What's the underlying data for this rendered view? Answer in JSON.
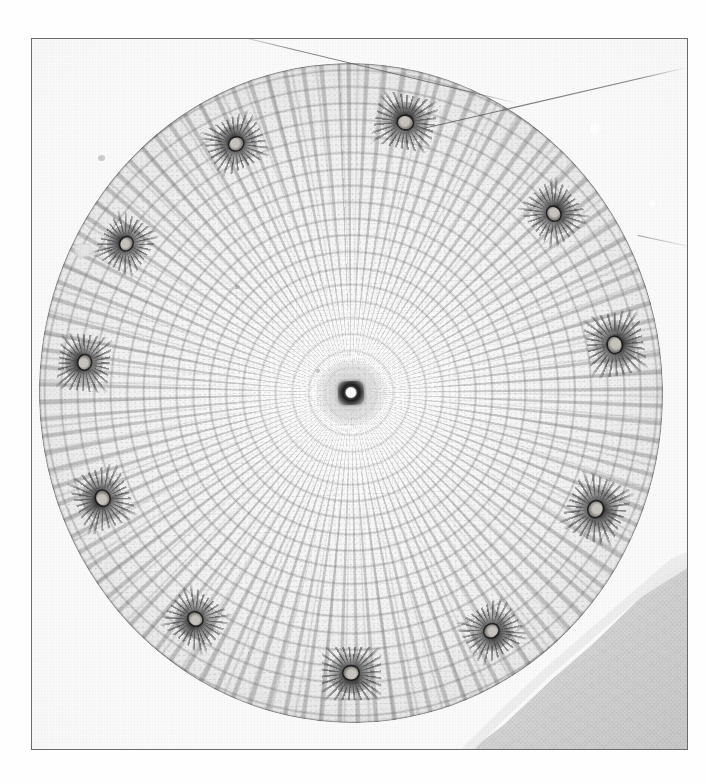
{
  "plate": {
    "medium": "monochrome photographic plate",
    "background_color": "#ffffff",
    "plate_color": "#fafafa",
    "frame_border_color": "#6b6b6b",
    "frame": {
      "x": 31,
      "y": 38,
      "width": 657,
      "height": 712
    }
  },
  "specimen": {
    "kind": "plant-stem-cross-section",
    "outline_shape": "ellipse",
    "center": {
      "x": 348,
      "y": 393
    },
    "radius_x": 312,
    "radius_y": 330,
    "tissue_zones": [
      {
        "name": "central-strand",
        "tone": "#1d1d1d"
      },
      {
        "name": "inner-pith-parenchyma",
        "tone": "#fdfdfd"
      },
      {
        "name": "radial-parenchyma",
        "tone": "#f2f2f2"
      },
      {
        "name": "cortex",
        "tone": "#d2d2d2"
      },
      {
        "name": "epidermis",
        "tone": "#8c8c8c"
      }
    ]
  },
  "core": {
    "name": "central-canal",
    "ring_color": "#1d1d1d",
    "lumen_color": "#ffffff"
  },
  "vascular_bundles": [
    {
      "id": 1,
      "angle_deg": -76,
      "radius_pct": 84,
      "scale": 1.0,
      "rotate_deg": 14
    },
    {
      "id": 2,
      "angle_deg": -38,
      "radius_pct": 85,
      "scale": 0.95,
      "rotate_deg": 52
    },
    {
      "id": 3,
      "angle_deg": -8,
      "radius_pct": 86,
      "scale": 1.05,
      "rotate_deg": 82
    },
    {
      "id": 4,
      "angle_deg": 26,
      "radius_pct": 86,
      "scale": 1.05,
      "rotate_deg": 116
    },
    {
      "id": 5,
      "angle_deg": 60,
      "radius_pct": 85,
      "scale": 0.95,
      "rotate_deg": 150
    },
    {
      "id": 6,
      "angle_deg": 92,
      "radius_pct": 85,
      "scale": 1.0,
      "rotate_deg": 182
    },
    {
      "id": 7,
      "angle_deg": 128,
      "radius_pct": 85,
      "scale": 0.95,
      "rotate_deg": 218
    },
    {
      "id": 8,
      "angle_deg": 160,
      "radius_pct": 86,
      "scale": 1.0,
      "rotate_deg": 250
    },
    {
      "id": 9,
      "angle_deg": 188,
      "radius_pct": 86,
      "scale": 0.95,
      "rotate_deg": 278
    },
    {
      "id": 10,
      "angle_deg": 214,
      "radius_pct": 85,
      "scale": 0.9,
      "rotate_deg": 304
    },
    {
      "id": 11,
      "angle_deg": 246,
      "radius_pct": 84,
      "scale": 0.95,
      "rotate_deg": 336
    }
  ],
  "artifacts": {
    "hair_top": "fibre-streak-upper-left",
    "hair_right": "fibre-streak-upper-right",
    "hair_right_short": "fibre-streak-right-edge",
    "wedge": "torn-grey-mount-corner",
    "specks": [
      "speck-upper-left",
      "bubble-left",
      "bubble-upper-right",
      "bubble-right",
      "fleck-mid-left",
      "fleck-lower-left"
    ]
  }
}
